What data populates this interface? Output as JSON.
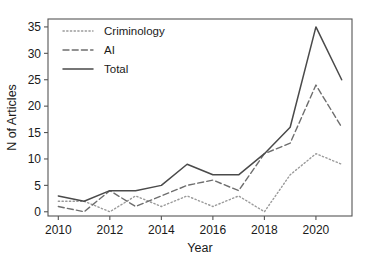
{
  "chart_data": {
    "type": "line",
    "title": "",
    "xlabel": "Year",
    "ylabel": "N of Articles",
    "x": [
      2010,
      2011,
      2012,
      2013,
      2014,
      2015,
      2016,
      2017,
      2018,
      2019,
      2020,
      2021
    ],
    "xlim": [
      2009.6,
      2021.4
    ],
    "ylim": [
      -0.8,
      36.5
    ],
    "xticks": [
      2010,
      2012,
      2014,
      2016,
      2018,
      2020
    ],
    "xtick_labels": [
      "2010",
      "2012",
      "2014",
      "2016",
      "2018",
      "2020"
    ],
    "yticks": [
      0,
      5,
      10,
      15,
      20,
      25,
      30,
      35
    ],
    "ytick_labels": [
      "0",
      "5",
      "10",
      "15",
      "20",
      "25",
      "30",
      "35"
    ],
    "grid": false,
    "legend_position": "top-left",
    "series": [
      {
        "name": "Criminology",
        "style": "dotted",
        "color": "#9a9a9a",
        "values": [
          2,
          2,
          0,
          3,
          1,
          3,
          1,
          3,
          0,
          7,
          11,
          9
        ]
      },
      {
        "name": "AI",
        "style": "dashed",
        "color": "#6e6e6e",
        "values": [
          1,
          0,
          4,
          1,
          3,
          5,
          6,
          4,
          11,
          13,
          24,
          16
        ]
      },
      {
        "name": "Total",
        "style": "solid",
        "color": "#4a4a4a",
        "values": [
          3,
          2,
          4,
          4,
          5,
          9,
          7,
          7,
          11,
          16,
          35,
          25
        ]
      }
    ]
  },
  "figure": {
    "background_color": "#ffffff",
    "axis_color": "#555555"
  }
}
